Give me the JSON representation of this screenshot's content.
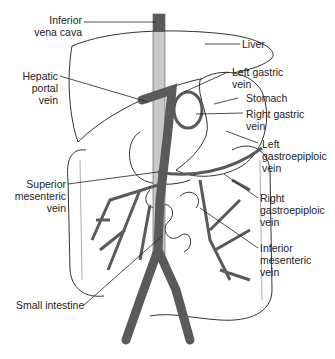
{
  "figure": {
    "labels": {
      "inferior_vena_cava": "Inferior\nvena cava",
      "liver": "Liver",
      "hepatic_portal_vein": "Hepatic\nportal\nvein",
      "left_gastric_vein": "Left gastric\nvein",
      "stomach": "Stomach",
      "right_gastric_vein": "Right gastric\nvein",
      "left_gastroepiploic_vein": "Left\ngastroepiploic\nvein",
      "superior_mesenteric_vein": "Superior\nmesenteric\nvein",
      "right_gastroepiploic_vein": "Right\ngastroepiploic\nvein",
      "inferior_mesenteric_vein": "Inferior\nmesenteric\nvein",
      "small_intestine": "Small intestine"
    },
    "colors": {
      "vein": "#5a5a5a",
      "vena_cava_light": "#c8c8c8",
      "outline": "#333333",
      "leader_line": "#222222",
      "background": "#ffffff"
    }
  }
}
